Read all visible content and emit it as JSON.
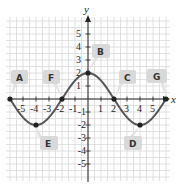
{
  "chart_data": {
    "type": "line",
    "title": "",
    "xlabel": "x",
    "ylabel": "y",
    "xlim": [
      -6,
      6
    ],
    "ylim": [
      -6,
      6
    ],
    "grid": true,
    "x_ticks": [
      -5,
      -4,
      -3,
      -2,
      -1,
      1,
      2,
      3,
      4,
      5
    ],
    "y_ticks": [
      -5,
      -4,
      -3,
      -2,
      -1,
      1,
      2,
      3,
      4,
      5
    ],
    "x_tick_labels": [
      "-5",
      "-4",
      "-3",
      "-2",
      "-1",
      "1",
      "2",
      "3",
      "4",
      "5"
    ],
    "y_tick_labels": [
      "-5",
      "-4",
      "-3",
      "-2",
      "-1",
      "1",
      "2",
      "3",
      "4",
      "5"
    ],
    "series": [
      {
        "name": "curve",
        "function": "2cos(pi*x/4)",
        "color": "#555555",
        "x": [
          -6,
          -5,
          -4,
          -3,
          -2,
          -1,
          0,
          1,
          2,
          3,
          4,
          5,
          6
        ],
        "y": [
          0,
          -1.41,
          -2,
          -1.41,
          0,
          1.41,
          2,
          1.41,
          0,
          -1.41,
          -2,
          -1.41,
          0
        ]
      }
    ],
    "points": [
      {
        "x": -6,
        "y": 0
      },
      {
        "x": -4,
        "y": -2
      },
      {
        "x": -2,
        "y": 0
      },
      {
        "x": 0,
        "y": 2
      },
      {
        "x": 2,
        "y": 0
      },
      {
        "x": 4,
        "y": -2
      },
      {
        "x": 6,
        "y": 0
      }
    ],
    "annotations": [
      {
        "label": "A",
        "points_to": [
          -6,
          0
        ]
      },
      {
        "label": "B",
        "points_to": [
          0,
          2
        ]
      },
      {
        "label": "C",
        "points_to": [
          2,
          0
        ]
      },
      {
        "label": "D",
        "points_to": [
          4,
          -2
        ]
      },
      {
        "label": "E",
        "points_to": [
          -4,
          -2
        ]
      },
      {
        "label": "F",
        "points_to": [
          -2,
          0
        ]
      },
      {
        "label": "G",
        "points_to": [
          6,
          0
        ]
      }
    ]
  },
  "labels": {
    "x_axis": "x",
    "y_axis": "y",
    "A": "A",
    "B": "B",
    "C": "C",
    "D": "D",
    "E": "E",
    "F": "F",
    "G": "G",
    "xt": [
      "-5",
      "-4",
      "-3",
      "-2",
      "-1",
      "1",
      "2",
      "3",
      "4",
      "5"
    ],
    "yt": [
      "5",
      "4",
      "3",
      "2",
      "1",
      "-1",
      "-2",
      "-3",
      "-4",
      "-5"
    ]
  },
  "colors": {
    "curve": "#555555",
    "grid": "#d8d8d8",
    "axis": "#222222",
    "callout": "#d9d9d9"
  }
}
